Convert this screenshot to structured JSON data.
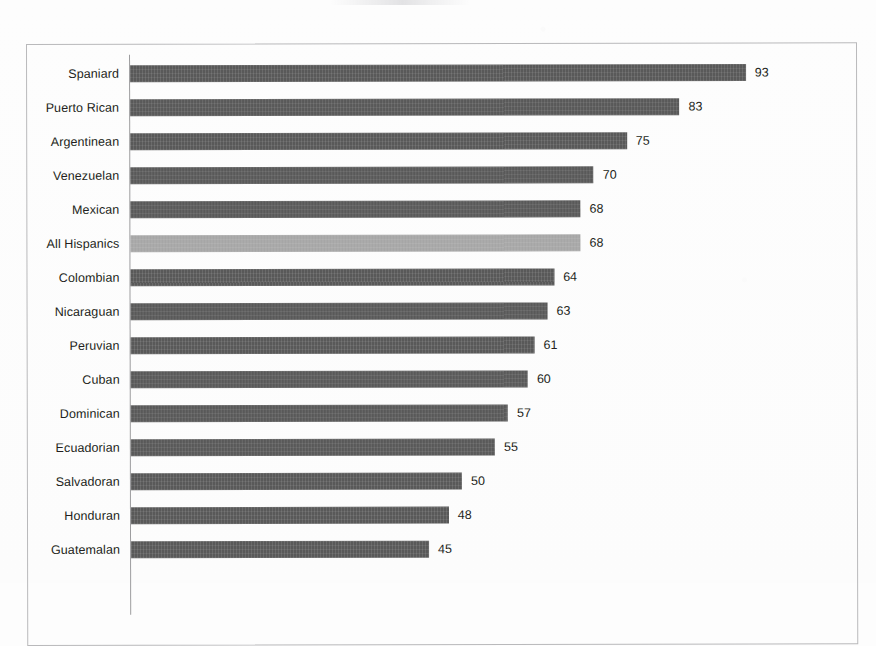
{
  "document": {
    "type": "scanned-page",
    "note_visible_text_only": true
  },
  "chart_data": {
    "type": "bar",
    "orientation": "horizontal",
    "title": "",
    "subtitle": "",
    "xlabel": "",
    "ylabel": "",
    "categories": [
      "Spaniard",
      "Puerto Rican",
      "Argentinean",
      "Venezuelan",
      "Mexican",
      "All Hispanics",
      "Colombian",
      "Nicaraguan",
      "Peruvian",
      "Cuban",
      "Dominican",
      "Ecuadorian",
      "Salvadoran",
      "Honduran",
      "Guatemalan"
    ],
    "values": [
      93,
      83,
      75,
      70,
      68,
      68,
      64,
      63,
      61,
      60,
      57,
      55,
      50,
      48,
      45
    ],
    "data_labels": [
      "93",
      "83",
      "75",
      "70",
      "68",
      "68",
      "64",
      "63",
      "61",
      "60",
      "57",
      "55",
      "50",
      "48",
      "45"
    ],
    "highlighted_category": "All Hispanics",
    "xlim": [
      0,
      100
    ],
    "grid": false,
    "legend": null,
    "colors": {
      "bar": "#595959",
      "bar_highlight": "#a6a6a6",
      "text": "#231f20",
      "axis": "#9d9d9f",
      "frame": "#b9b9bb",
      "page": "#fdfdfd"
    }
  }
}
